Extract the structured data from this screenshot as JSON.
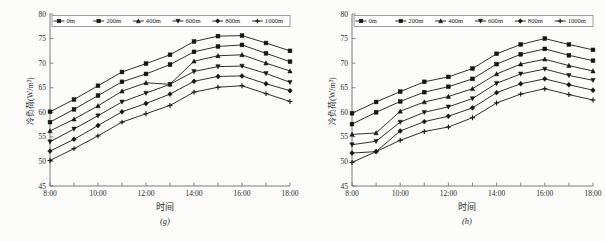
{
  "figure": {
    "panels": [
      {
        "caption": "(g)",
        "xlabel": "时间",
        "ylabel": "冷负荷(W/m²)",
        "chart_data": {
          "type": "line",
          "title": "",
          "xlabel": "时间",
          "ylabel": "冷负荷(W/m²)",
          "grid": false,
          "legend_position": "top",
          "ylim": [
            45,
            80
          ],
          "yticks": [
            45,
            50,
            55,
            60,
            65,
            70,
            75,
            80
          ],
          "x": [
            "8:00",
            "9:00",
            "10:00",
            "11:00",
            "12:00",
            "13:00",
            "14:00",
            "15:00",
            "16:00",
            "17:00",
            "18:00"
          ],
          "xticks_labeled": [
            "8:00",
            "10:00",
            "12:00",
            "14:00",
            "16:00",
            "18:00"
          ],
          "series": [
            {
              "name": "0m",
              "marker": "square",
              "values": [
                60.1,
                62.6,
                65.4,
                68.2,
                69.9,
                71.7,
                74.4,
                75.5,
                75.6,
                74.1,
                72.5
              ]
            },
            {
              "name": "200m",
              "marker": "square",
              "values": [
                58.0,
                60.6,
                63.4,
                66.2,
                67.8,
                69.7,
                72.3,
                73.4,
                73.7,
                72.0,
                70.3
              ]
            },
            {
              "name": "400m",
              "marker": "triangle",
              "values": [
                56.2,
                58.6,
                61.3,
                64.3,
                66.0,
                65.7,
                70.4,
                71.5,
                71.7,
                70.0,
                68.4
              ]
            },
            {
              "name": "600m",
              "marker": "dtriangle",
              "values": [
                54.0,
                56.6,
                59.3,
                62.1,
                63.9,
                65.7,
                68.3,
                69.3,
                69.4,
                67.9,
                66.1
              ]
            },
            {
              "name": "800m",
              "marker": "diamond",
              "values": [
                52.1,
                54.5,
                57.3,
                60.1,
                61.8,
                63.7,
                66.3,
                67.3,
                67.4,
                65.8,
                64.4
              ]
            },
            {
              "name": "1000m",
              "marker": "plus",
              "values": [
                50.2,
                52.6,
                55.2,
                58.0,
                59.7,
                61.4,
                64.1,
                65.1,
                65.4,
                63.8,
                62.2
              ]
            }
          ]
        }
      },
      {
        "caption": "(h)",
        "xlabel": "时间",
        "ylabel": "冷负荷(W/m²)",
        "chart_data": {
          "type": "line",
          "title": "",
          "xlabel": "时间",
          "ylabel": "冷负荷(W/m²)",
          "grid": false,
          "legend_position": "top",
          "ylim": [
            45,
            80
          ],
          "yticks": [
            45,
            50,
            55,
            60,
            65,
            70,
            75,
            80
          ],
          "x": [
            "8:00",
            "9:00",
            "10:00",
            "11:00",
            "12:00",
            "13:00",
            "14:00",
            "15:00",
            "16:00",
            "17:00",
            "18:00"
          ],
          "xticks_labeled": [
            "8:00",
            "10:00",
            "12:00",
            "14:00",
            "16:00",
            "18:00"
          ],
          "series": [
            {
              "name": "0m",
              "marker": "square",
              "values": [
                59.8,
                62.1,
                64.2,
                66.2,
                67.2,
                68.9,
                71.9,
                73.8,
                75.0,
                73.8,
                72.7
              ]
            },
            {
              "name": "200m",
              "marker": "square",
              "values": [
                57.6,
                60.0,
                62.2,
                64.1,
                65.2,
                66.8,
                69.8,
                71.8,
                72.9,
                71.6,
                70.5
              ]
            },
            {
              "name": "400m",
              "marker": "triangle",
              "values": [
                55.5,
                55.8,
                60.2,
                62.1,
                63.2,
                64.8,
                67.8,
                69.8,
                70.8,
                69.5,
                68.4
              ]
            },
            {
              "name": "600m",
              "marker": "dtriangle",
              "values": [
                53.4,
                54.1,
                58.0,
                60.0,
                61.1,
                62.8,
                65.9,
                67.8,
                68.8,
                67.5,
                66.5
              ]
            },
            {
              "name": "800m",
              "marker": "diamond",
              "values": [
                51.7,
                52.0,
                56.2,
                58.1,
                59.2,
                60.9,
                64.0,
                65.8,
                66.8,
                65.6,
                64.5
              ]
            },
            {
              "name": "1000m",
              "marker": "plus",
              "values": [
                49.8,
                52.0,
                54.3,
                56.1,
                57.0,
                58.9,
                61.9,
                63.7,
                64.8,
                63.6,
                62.5
              ]
            }
          ]
        }
      }
    ]
  },
  "colors": {
    "ink": "#1a1a1a",
    "axis": "#6e6e6e",
    "background": "#fcfcfb"
  }
}
